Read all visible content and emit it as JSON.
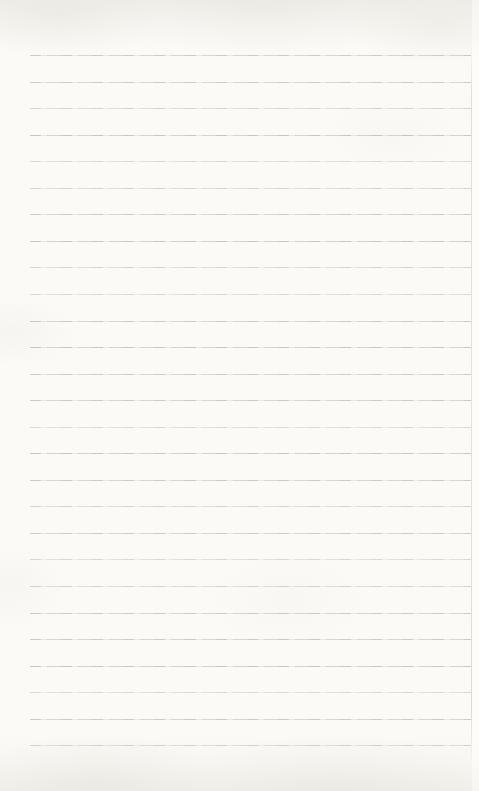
{
  "page": {
    "text_content": "",
    "colors": {
      "paper": "#fbfaf7",
      "edge_shading": "#d4d0c5",
      "rule_line": "#8e8c82",
      "page_edge_line": "#96938a"
    },
    "ruling": {
      "line_count": 27,
      "first_line_y": 55,
      "line_spacing": 26.55,
      "line_left_x": 30,
      "line_right_x": 471
    }
  }
}
